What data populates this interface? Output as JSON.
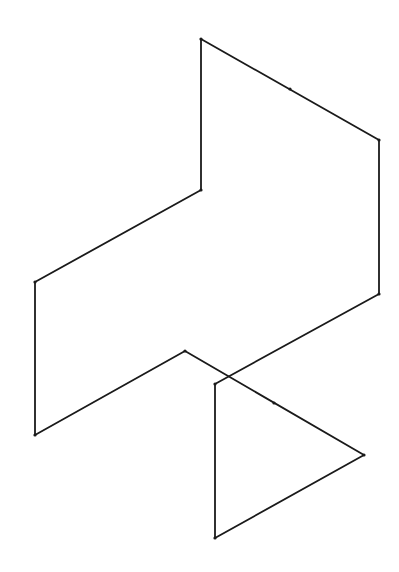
{
  "diagram": {
    "type": "wireframe-line-figure",
    "width": 399,
    "height": 572,
    "background": "#ffffff",
    "stroke_color": "#1a1a1a",
    "stroke_width": 1.8,
    "vertex_radius": 1.6,
    "vertices": [
      {
        "id": "A",
        "x": 201,
        "y": 39
      },
      {
        "id": "B",
        "x": 379,
        "y": 140
      },
      {
        "id": "C",
        "x": 379,
        "y": 294
      },
      {
        "id": "D",
        "x": 215,
        "y": 384
      },
      {
        "id": "E",
        "x": 215,
        "y": 538
      },
      {
        "id": "F",
        "x": 364,
        "y": 455
      },
      {
        "id": "G",
        "x": 185,
        "y": 351
      },
      {
        "id": "H",
        "x": 35,
        "y": 435
      },
      {
        "id": "I",
        "x": 35,
        "y": 282
      },
      {
        "id": "J",
        "x": 201,
        "y": 190
      }
    ],
    "midpoints": [
      {
        "id": "M1",
        "x": 290,
        "y": 89,
        "on_edge": "A-B"
      },
      {
        "id": "M2",
        "x": 274,
        "y": 403,
        "on_edge": "F-G"
      }
    ],
    "edges": [
      [
        "A",
        "B"
      ],
      [
        "B",
        "C"
      ],
      [
        "C",
        "D"
      ],
      [
        "D",
        "E"
      ],
      [
        "E",
        "F"
      ],
      [
        "F",
        "G"
      ],
      [
        "G",
        "H"
      ],
      [
        "H",
        "I"
      ],
      [
        "I",
        "J"
      ],
      [
        "J",
        "A"
      ]
    ]
  }
}
